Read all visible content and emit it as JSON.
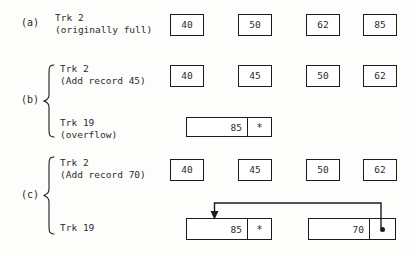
{
  "figure": {
    "background_color": "#fdfdfc",
    "ink_color": "#1c1c1c",
    "sections": [
      {
        "letter": "(a)",
        "rows": [
          {
            "label_line1": "Trk 2",
            "label_line2": "(originally full)",
            "kind": "track2",
            "records": [
              "40",
              "50",
              "62",
              "85"
            ]
          }
        ]
      },
      {
        "letter": "(b)",
        "rows": [
          {
            "label_line1": "Trk 2",
            "label_line2": "(Add record 45)",
            "kind": "track2",
            "records": [
              "40",
              "45",
              "50",
              "62"
            ]
          },
          {
            "label_line1": "Trk 19",
            "label_line2": "(overflow)",
            "kind": "overflow",
            "overflow_records": [
              {
                "value": "85",
                "link": "*"
              }
            ]
          }
        ]
      },
      {
        "letter": "(c)",
        "rows": [
          {
            "label_line1": "Trk 2",
            "label_line2": "(Add record 70)",
            "kind": "track2",
            "records": [
              "40",
              "45",
              "50",
              "62"
            ]
          },
          {
            "label_line1": "Trk 19",
            "label_line2": "",
            "kind": "overflow",
            "overflow_records": [
              {
                "value": "85",
                "link": "*"
              },
              {
                "value": "70",
                "link": "dot"
              }
            ],
            "pointer": {
              "from_record": 1,
              "to_record": 0,
              "description": "link from record 70 back to record 85"
            }
          }
        ]
      }
    ]
  }
}
